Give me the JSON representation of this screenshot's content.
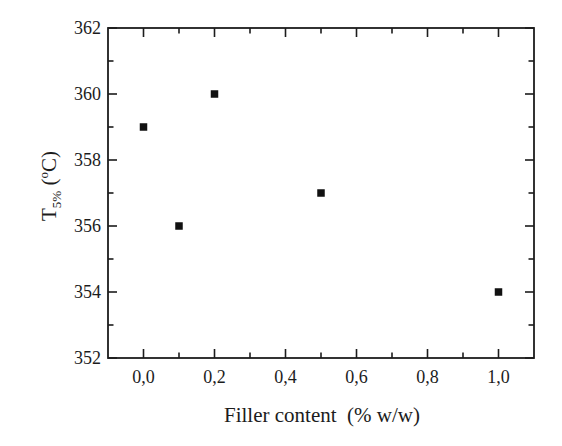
{
  "figure": {
    "bg_color": "#ffffff",
    "ink_color": "#1c1c1c",
    "marker_color": "#111111"
  },
  "chart_data": {
    "type": "scatter",
    "title": "",
    "xlabel": "Filler content  (% w/w)",
    "ylabel": "T5% (oC)",
    "ylabel_rich": [
      {
        "text": "T",
        "script": "normal"
      },
      {
        "text": "5%",
        "script": "sub"
      },
      {
        "text": " (",
        "script": "normal"
      },
      {
        "text": "o",
        "script": "sup"
      },
      {
        "text": "C)",
        "script": "normal"
      }
    ],
    "xlim": [
      -0.1,
      1.1
    ],
    "ylim": [
      352,
      362
    ],
    "x_major_ticks": [
      0.0,
      0.2,
      0.4,
      0.6,
      0.8,
      1.0
    ],
    "x_tick_labels": [
      "0,0",
      "0,2",
      "0,4",
      "0,6",
      "0,8",
      "1,0"
    ],
    "x_minor_ticks": [
      0.1,
      0.3,
      0.5,
      0.7,
      0.9
    ],
    "y_major_ticks": [
      352,
      354,
      356,
      358,
      360,
      362
    ],
    "y_tick_labels": [
      "352",
      "354",
      "356",
      "358",
      "360",
      "362"
    ],
    "y_minor_ticks": [
      353,
      355,
      357,
      359,
      361
    ],
    "grid": false,
    "legend": "none",
    "frame": "box-with-inward-ticks",
    "marker": {
      "shape": "filled-square",
      "size": 7.5
    },
    "series": [
      {
        "name": "T5% vs filler content",
        "points": [
          {
            "x": 0.0,
            "y": 359
          },
          {
            "x": 0.1,
            "y": 356
          },
          {
            "x": 0.2,
            "y": 360
          },
          {
            "x": 0.5,
            "y": 357
          },
          {
            "x": 1.0,
            "y": 354
          }
        ]
      }
    ]
  }
}
